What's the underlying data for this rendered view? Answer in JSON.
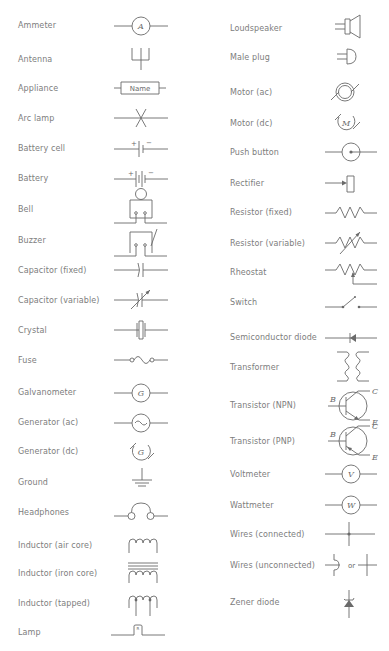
{
  "left_column": [
    {
      "label": "Ammeter",
      "icon": "ammeter-symbol",
      "symbol_text": "A"
    },
    {
      "label": "Antenna",
      "icon": "antenna-symbol"
    },
    {
      "label": "Appliance",
      "icon": "appliance-symbol",
      "symbol_text": "Name"
    },
    {
      "label": "Arc lamp",
      "icon": "arc-lamp-symbol"
    },
    {
      "label": "Battery cell",
      "icon": "battery-cell-symbol",
      "plus": "+",
      "minus": "−"
    },
    {
      "label": "Battery",
      "icon": "battery-symbol",
      "plus": "+",
      "minus": "−"
    },
    {
      "label": "Bell",
      "icon": "bell-symbol"
    },
    {
      "label": "Buzzer",
      "icon": "buzzer-symbol"
    },
    {
      "label": "Capacitor (fixed)",
      "icon": "capacitor-fixed-symbol"
    },
    {
      "label": "Capacitor (variable)",
      "icon": "capacitor-variable-symbol"
    },
    {
      "label": "Crystal",
      "icon": "crystal-symbol"
    },
    {
      "label": "Fuse",
      "icon": "fuse-symbol"
    },
    {
      "label": "Galvanometer",
      "icon": "galvanometer-symbol",
      "symbol_text": "G"
    },
    {
      "label": "Generator (ac)",
      "icon": "generator-ac-symbol",
      "symbol_text": "~"
    },
    {
      "label": "Generator (dc)",
      "icon": "generator-dc-symbol",
      "symbol_text": "G"
    },
    {
      "label": "Ground",
      "icon": "ground-symbol"
    },
    {
      "label": "Headphones",
      "icon": "headphones-symbol"
    },
    {
      "label": "Inductor (air core)",
      "icon": "inductor-air-core-symbol"
    },
    {
      "label": "Inductor (iron core)",
      "icon": "inductor-iron-core-symbol"
    },
    {
      "label": "Inductor (tapped)",
      "icon": "inductor-tapped-symbol"
    },
    {
      "label": "Lamp",
      "icon": "lamp-symbol"
    }
  ],
  "right_column": [
    {
      "label": "Loudspeaker",
      "icon": "loudspeaker-symbol"
    },
    {
      "label": "Male plug",
      "icon": "male-plug-symbol"
    },
    {
      "label": "Motor (ac)",
      "icon": "motor-ac-symbol"
    },
    {
      "label": "Motor (dc)",
      "icon": "motor-dc-symbol",
      "symbol_text": "M"
    },
    {
      "label": "Push button",
      "icon": "push-button-symbol"
    },
    {
      "label": "Rectifier",
      "icon": "rectifier-symbol"
    },
    {
      "label": "Resistor (fixed)",
      "icon": "resistor-fixed-symbol"
    },
    {
      "label": "Resistor (variable)",
      "icon": "resistor-variable-symbol"
    },
    {
      "label": "Rheostat",
      "icon": "rheostat-symbol"
    },
    {
      "label": "Switch",
      "icon": "switch-symbol"
    },
    {
      "label": "Semiconductor diode",
      "icon": "semiconductor-diode-symbol"
    },
    {
      "label": "Transformer",
      "icon": "transformer-symbol"
    },
    {
      "label": "Transistor (NPN)",
      "icon": "transistor-npn-symbol",
      "terminals": {
        "b": "B",
        "c": "C",
        "e": "E"
      }
    },
    {
      "label": "Transistor (PNP)",
      "icon": "transistor-pnp-symbol",
      "terminals": {
        "b": "B",
        "c": "C",
        "e": "E"
      }
    },
    {
      "label": "Voltmeter",
      "icon": "voltmeter-symbol",
      "symbol_text": "V"
    },
    {
      "label": "Wattmeter",
      "icon": "wattmeter-symbol",
      "symbol_text": "W"
    },
    {
      "label": "Wires (connected)",
      "icon": "wires-connected-symbol"
    },
    {
      "label": "Wires (unconnected)",
      "icon": "wires-unconnected-symbol",
      "symbol_text": "or"
    },
    {
      "label": "Zener diode",
      "icon": "zener-diode-symbol"
    }
  ]
}
